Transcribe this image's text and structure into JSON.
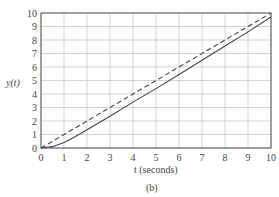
{
  "chart_data": {
    "type": "line",
    "title": "",
    "xlabel": "t (seconds)",
    "ylabel": "y(t)",
    "caption": "(b)",
    "xlim": [
      0,
      10
    ],
    "ylim": [
      0,
      10
    ],
    "grid": true,
    "x_ticks": [
      "0",
      "1",
      "2",
      "3",
      "4",
      "5",
      "6",
      "7",
      "8",
      "9",
      "10"
    ],
    "y_ticks": [
      "0",
      "1",
      "2",
      "3",
      "4",
      "5",
      "6",
      "7",
      "8",
      "9",
      "10"
    ],
    "series": [
      {
        "name": "input ramp (dashed)",
        "style": "dashed",
        "x": [
          0,
          1,
          2,
          3,
          4,
          5,
          6,
          7,
          8,
          9,
          10
        ],
        "y": [
          0,
          1,
          2,
          3,
          4,
          5,
          6,
          7,
          8,
          9,
          10
        ]
      },
      {
        "name": "response (solid)",
        "style": "solid",
        "x": [
          0,
          0.5,
          1,
          1.5,
          2,
          3,
          4,
          5,
          6,
          7,
          8,
          9,
          10
        ],
        "y": [
          0,
          0.1,
          0.4,
          0.85,
          1.35,
          2.35,
          3.4,
          4.4,
          5.45,
          6.5,
          7.55,
          8.6,
          9.7
        ]
      }
    ]
  },
  "labels": {
    "ylabel": "y(t)",
    "xlabel": "t (seconds)",
    "caption": "(b)"
  }
}
